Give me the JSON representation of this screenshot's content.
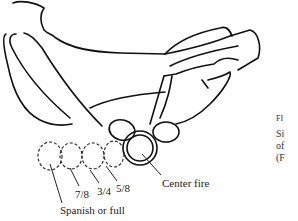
{
  "figure": {
    "labels": {
      "center_fire": "Center fire",
      "five_eighths": "5/8",
      "three_quarters": "3/4",
      "seven_eighths": "7/8",
      "spanish_full": "Spanish or full"
    },
    "caption_fragment": {
      "line0": "FI",
      "line1": "Si",
      "line2": "of",
      "line3": "(F"
    }
  }
}
